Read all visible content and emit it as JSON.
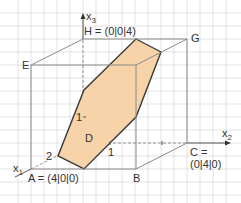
{
  "colors": {
    "grid": "#dcdcdc",
    "edge": "#8a8a8a",
    "hexagon_fill": "#f6d3a8",
    "hexagon_stroke": "#3a3a3a",
    "axis": "#555555"
  },
  "axes": {
    "x1": "x",
    "x1_sub": "1",
    "x2": "x",
    "x2_sub": "2",
    "x3": "x",
    "x3_sub": "3"
  },
  "points": {
    "A": "A = (4|0|0)",
    "B": "B",
    "C_line1": "C =",
    "C_line2": "(0|4|0)",
    "D": "D",
    "E": "E",
    "G": "G",
    "H": "H = (0|0|4)"
  },
  "ticks": {
    "x1_tick": "2",
    "x2_tick": "1",
    "x3_tick": "1"
  }
}
